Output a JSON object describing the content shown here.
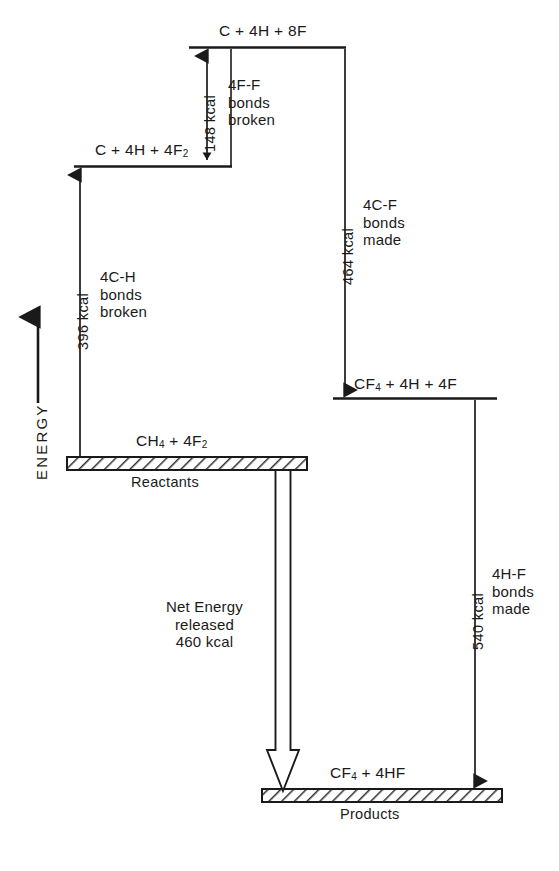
{
  "figure": {
    "type": "energy-level-diagram",
    "axis": {
      "label": "ENERGY",
      "direction": "up"
    },
    "levels": [
      {
        "id": "top",
        "species": "C + 4H + 8F",
        "species_html": "C + 4H + 8F",
        "plate": null
      },
      {
        "id": "second",
        "species": "C + 4H + 4F2",
        "species_html": "C + 4H + 4F<sub>2</sub>",
        "plate": null
      },
      {
        "id": "reactants",
        "species": "CH4 + 4F2",
        "species_html": "CH<sub>4</sub> + 4F<sub>2</sub>",
        "plate": "Reactants"
      },
      {
        "id": "intermediate",
        "species": "CF4 + 4H + 4F",
        "species_html": "CF<sub>4</sub> + 4H + 4F",
        "plate": null
      },
      {
        "id": "products",
        "species": "CF4 + 4HF",
        "species_html": "CF<sub>4</sub> + 4HF",
        "plate": "Products"
      }
    ],
    "transitions": [
      {
        "id": "ff-broken",
        "value": "148 kcal",
        "label_line1": "4F-F",
        "label_line2": "bonds",
        "label_line3": "broken",
        "direction": "up"
      },
      {
        "id": "ch-broken",
        "value": "396 kcal",
        "label_line1": "4C-H",
        "label_line2": "bonds",
        "label_line3": "broken",
        "direction": "up"
      },
      {
        "id": "cf-made",
        "value": "464 kcal",
        "label_line1": "4C-F",
        "label_line2": "bonds",
        "label_line3": "made",
        "direction": "down"
      },
      {
        "id": "hf-made",
        "value": "540 kcal",
        "label_line1": "4H-F",
        "label_line2": "bonds",
        "label_line3": "made",
        "direction": "down"
      }
    ],
    "net": {
      "line1": "Net Energy",
      "line2": "released",
      "line3": "460 kcal"
    },
    "colors": {
      "ink": "#1a1a1a",
      "background": "#ffffff",
      "hatch": "#333333"
    }
  },
  "chart_data": {
    "type": "diagram",
    "ylabel": "ENERGY",
    "levels": [
      {
        "name": "C + 4H + 8F",
        "relative_energy_kcal": 1084
      },
      {
        "name": "C + 4H + 4F2",
        "relative_energy_kcal": 936
      },
      {
        "name": "CH4 + 4F2",
        "relative_energy_kcal": 540
      },
      {
        "name": "CF4 + 4H + 4F",
        "relative_energy_kcal": 620
      },
      {
        "name": "CF4 + 4HF",
        "relative_energy_kcal": 80
      }
    ],
    "steps": [
      {
        "from": "CH4 + 4F2",
        "to": "C + 4H + 4F2",
        "energy_kcal": 396,
        "process": "4C-H bonds broken",
        "sign": "+"
      },
      {
        "from": "C + 4H + 4F2",
        "to": "C + 4H + 8F",
        "energy_kcal": 148,
        "process": "4F-F bonds broken",
        "sign": "+"
      },
      {
        "from": "C + 4H + 8F",
        "to": "CF4 + 4H + 4F",
        "energy_kcal": 464,
        "process": "4C-F bonds made",
        "sign": "-"
      },
      {
        "from": "CF4 + 4H + 4F",
        "to": "CF4 + 4HF",
        "energy_kcal": 540,
        "process": "4H-F bonds made",
        "sign": "-"
      }
    ],
    "net_energy_released_kcal": 460
  }
}
